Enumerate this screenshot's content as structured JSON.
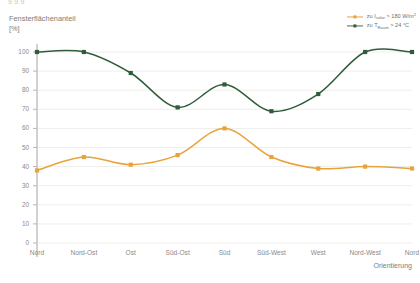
{
  "top_clip_text": "g g                                                                 g",
  "axis_title_y": "Fensterflächenanteil\n[%]",
  "axis_title_x": "Orientierung",
  "legend": {
    "items": [
      {
        "name": "legend-orange",
        "prefix": "zu I",
        "sub": "solar",
        "text": " > 180 W/m",
        "sup": "2",
        "color": "#e8a33d"
      },
      {
        "name": "legend-green",
        "prefix": "zu T",
        "sub": "Raum",
        "text": " > 24 °C",
        "sup": "",
        "color": "#2f5d3a"
      }
    ]
  },
  "chart_data": {
    "type": "line",
    "title": "",
    "xlabel": "Orientierung",
    "ylabel": "Fensterflächenanteil [%]",
    "categories": [
      "Nord",
      "Nord-Ost",
      "Ost",
      "Süd-Ost",
      "Süd",
      "Süd-West",
      "West",
      "Nord-West",
      "Nord"
    ],
    "ylim": [
      0,
      100
    ],
    "ytick_values": [
      0,
      10,
      20,
      30,
      40,
      50,
      60,
      70,
      80,
      90,
      100
    ],
    "grid": true,
    "legend_position": "top-right",
    "series": [
      {
        "name": "zu Isolar > 180 W/m2",
        "color": "#e8a33d",
        "values": [
          38,
          45,
          41,
          46,
          60,
          45,
          39,
          40,
          39
        ]
      },
      {
        "name": "zu TRaum > 24 °C",
        "color": "#2f5d3a",
        "values": [
          100,
          100,
          89,
          71,
          83,
          69,
          78,
          100,
          100
        ]
      }
    ]
  }
}
